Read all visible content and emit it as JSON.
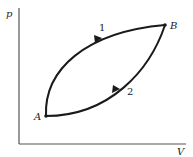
{
  "diagram": {
    "type": "pV-cycle",
    "axes": {
      "y_label": "p",
      "x_label": "V"
    },
    "points": [
      {
        "id": "A",
        "label": "A"
      },
      {
        "id": "B",
        "label": "B"
      }
    ],
    "paths": [
      {
        "id": "1",
        "label": "1",
        "from": "A",
        "to": "B",
        "direction": "A to B (upper curve)"
      },
      {
        "id": "2",
        "label": "2",
        "from": "B",
        "to": "A",
        "direction": "B to A (lower curve)"
      }
    ],
    "colors": {
      "line": "#1a1a1a",
      "axis": "#555555",
      "text": "#222222"
    }
  }
}
